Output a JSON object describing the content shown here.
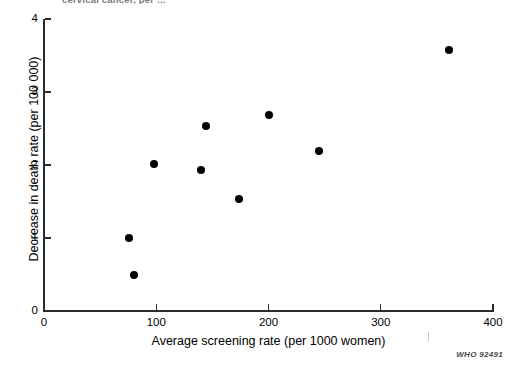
{
  "figure": {
    "title_partial": "cervical cancer, per ...",
    "source_code": "WHO 92491",
    "background_color": "#ffffff",
    "marker_color": "#000000",
    "axis_color": "#2b2b2b"
  },
  "chart_data": {
    "type": "scatter",
    "title": "cervical cancer, per ...",
    "xlabel": "Average screening rate (per 1000 women)",
    "ylabel": "Decrease in death rate (per 100 000)",
    "xlim": [
      0,
      400
    ],
    "ylim": [
      0,
      4
    ],
    "xticks": [
      0,
      100,
      200,
      300,
      400
    ],
    "yticks": [
      0,
      1,
      2,
      3,
      4
    ],
    "xtick_labels": [
      "0",
      "100",
      "200",
      "300",
      "400"
    ],
    "ytick_labels": [
      "0",
      "1",
      "2",
      "3",
      "4"
    ],
    "grid": false,
    "legend": null,
    "series": [
      {
        "name": "countries",
        "points": [
          {
            "x": 76,
            "y": 1.0
          },
          {
            "x": 80,
            "y": 0.49
          },
          {
            "x": 98,
            "y": 2.02
          },
          {
            "x": 140,
            "y": 1.93
          },
          {
            "x": 144,
            "y": 2.53
          },
          {
            "x": 174,
            "y": 1.53
          },
          {
            "x": 200,
            "y": 2.69
          },
          {
            "x": 245,
            "y": 2.19
          },
          {
            "x": 361,
            "y": 3.57
          }
        ]
      }
    ]
  }
}
